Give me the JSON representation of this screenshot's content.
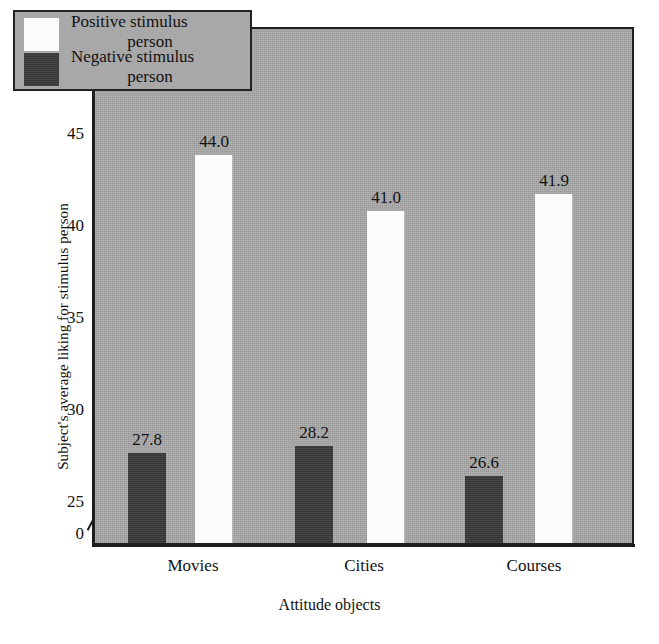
{
  "chart_data": {
    "type": "bar",
    "title": "",
    "xlabel": "Attitude objects",
    "ylabel": "Subject's average liking for stimulus person",
    "categories": [
      "Movies",
      "Cities",
      "Courses"
    ],
    "series": [
      {
        "name": "Positive stimulus person",
        "values": [
          44.0,
          41.0,
          41.9
        ],
        "color": "#fbfbfb"
      },
      {
        "name": "Negative stimulus person",
        "values": [
          27.8,
          28.2,
          26.6
        ],
        "color": "#3b3b3b"
      }
    ],
    "value_labels": {
      "negative": [
        "27.8",
        "28.2",
        "26.6"
      ],
      "positive": [
        "44.0",
        "41.0",
        "41.9"
      ]
    },
    "yticks": [
      25,
      30,
      35,
      40,
      45
    ],
    "ytick_labels": [
      "25",
      "30",
      "35",
      "40",
      "45"
    ],
    "y_origin_label": "0",
    "ylim": [
      25,
      46.5
    ],
    "axis_break": true,
    "grid": false,
    "legend_position": "top-left",
    "plot_background": "#a8a8a8"
  },
  "legend": {
    "entries": [
      {
        "line1": "Positive stimulus",
        "line2": "person",
        "swatch": "positive"
      },
      {
        "line1": "Negative stimulus",
        "line2": "person",
        "swatch": "negative"
      }
    ]
  }
}
